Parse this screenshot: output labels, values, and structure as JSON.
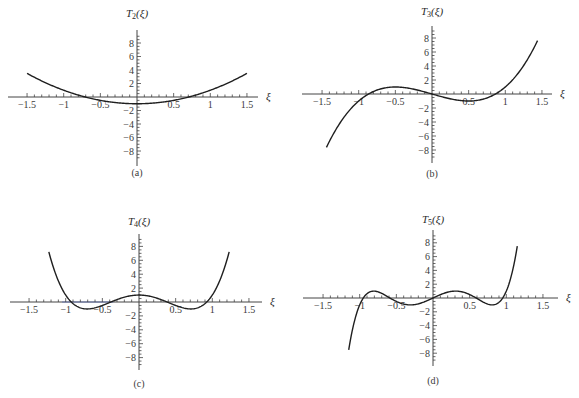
{
  "figure": {
    "panels": [
      {
        "id": "a",
        "caption": "(a)",
        "ylabel": "T",
        "ysub": "2",
        "yarg": "(ξ)",
        "xlabel": "ξ"
      },
      {
        "id": "b",
        "caption": "(b)",
        "ylabel": "T",
        "ysub": "3",
        "yarg": "(ξ)",
        "xlabel": "ξ"
      },
      {
        "id": "c",
        "caption": "(c)",
        "ylabel": "T",
        "ysub": "4",
        "yarg": "(ξ)",
        "xlabel": "ξ"
      },
      {
        "id": "d",
        "caption": "(d)",
        "ylabel": "T",
        "ysub": "5",
        "yarg": "(ξ)",
        "xlabel": "ξ"
      }
    ],
    "colors": {
      "curve": "#1f1f1f",
      "axis": "#444444",
      "highlight": "#6a78b0"
    }
  },
  "chart_data": [
    {
      "type": "line",
      "title": "",
      "caption": "(a)",
      "function": "T2(ξ) = 2ξ² − 1",
      "xlabel": "ξ",
      "ylabel": "T2(ξ)",
      "xlim": [
        -1.5,
        1.5
      ],
      "ylim": [
        -8,
        8
      ],
      "x_ticks": [
        "-1.5",
        "-1",
        "-0.5",
        "0.5",
        "1",
        "1.5"
      ],
      "y_ticks": [
        "8",
        "6",
        "4",
        "2",
        "-2",
        "-4",
        "-6",
        "-8"
      ],
      "grid": false,
      "domain": [
        -1.5,
        1.5
      ],
      "x": [
        -1.5,
        -1.0,
        -0.5,
        0,
        0.5,
        1.0,
        1.5
      ],
      "y": [
        3.5,
        1.0,
        -0.5,
        -1.0,
        -0.5,
        1.0,
        3.5
      ]
    },
    {
      "type": "line",
      "title": "",
      "caption": "(b)",
      "function": "T3(ξ) = 4ξ³ − 3ξ",
      "xlabel": "ξ",
      "ylabel": "T3(ξ)",
      "xlim": [
        -1.5,
        1.5
      ],
      "ylim": [
        -8,
        8
      ],
      "x_ticks": [
        "-1.5",
        "-1",
        "-0.5",
        "0.5",
        "1",
        "1.5"
      ],
      "y_ticks": [
        "8",
        "6",
        "4",
        "2",
        "-2",
        "-4",
        "-6",
        "-8"
      ],
      "grid": false,
      "domain": [
        -1.44,
        1.44
      ],
      "x": [
        -1.44,
        -1.0,
        -0.5,
        0,
        0.5,
        1.0,
        1.44
      ],
      "y": [
        -7.62,
        -1.0,
        1.0,
        0,
        -1.0,
        1.0,
        7.62
      ]
    },
    {
      "type": "line",
      "title": "",
      "caption": "(c)",
      "function": "T4(ξ) = 8ξ⁴ − 8ξ² + 1",
      "xlabel": "ξ",
      "ylabel": "T4(ξ)",
      "xlim": [
        -1.5,
        1.5
      ],
      "ylim": [
        -8,
        8
      ],
      "x_ticks": [
        "-1.5",
        "-1",
        "-0.5",
        "0.5",
        "1",
        "1.5"
      ],
      "y_ticks": [
        "8",
        "6",
        "4",
        "2",
        "-2",
        "-4",
        "-6",
        "-8"
      ],
      "grid": false,
      "domain": [
        -1.23,
        1.23
      ],
      "x": [
        -1.23,
        -1.0,
        -0.707,
        0,
        0.707,
        1.0,
        1.23
      ],
      "y": [
        7.8,
        1.0,
        -1.0,
        1.0,
        -1.0,
        1.0,
        7.8
      ]
    },
    {
      "type": "line",
      "title": "",
      "caption": "(d)",
      "function": "T5(ξ) = 16ξ⁵ − 20ξ³ + 5ξ",
      "xlabel": "ξ",
      "ylabel": "T5(ξ)",
      "xlim": [
        -1.5,
        1.5
      ],
      "ylim": [
        -8,
        8
      ],
      "x_ticks": [
        "-1.5",
        "-1",
        "-0.5",
        "0.5",
        "1",
        "1.5"
      ],
      "y_ticks": [
        "8",
        "6",
        "4",
        "2",
        "-2",
        "-4",
        "-6",
        "-8"
      ],
      "grid": false,
      "domain": [
        -1.15,
        1.15
      ],
      "x": [
        -1.15,
        -1.0,
        -0.809,
        -0.309,
        0,
        0.309,
        0.809,
        1.0,
        1.15
      ],
      "y": [
        -8.0,
        -1.0,
        1.0,
        -1.0,
        0,
        1.0,
        -1.0,
        1.0,
        8.0
      ]
    }
  ]
}
